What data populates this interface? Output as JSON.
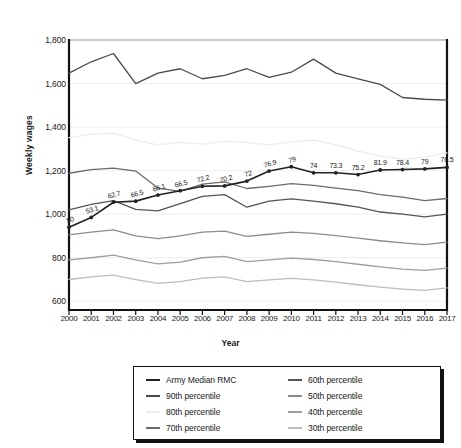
{
  "chart_data": {
    "type": "line",
    "title": "",
    "xlabel": "Year",
    "ylabel": "Weekly wages",
    "x": [
      2000,
      2001,
      2002,
      2003,
      2004,
      2005,
      2006,
      2007,
      2008,
      2009,
      2010,
      2011,
      2012,
      2013,
      2014,
      2015,
      2016,
      2017
    ],
    "xtick_labels": [
      "2000",
      "2001",
      "2002",
      "2003",
      "2004",
      "2005",
      "2006",
      "2007",
      "2008",
      "2009",
      "2010",
      "2011",
      "2012",
      "2013",
      "2014",
      "2015",
      "2016",
      "2017"
    ],
    "ylim": [
      560,
      1800
    ],
    "yticks": [
      600,
      800,
      1000,
      1200,
      1400,
      1600,
      1800
    ],
    "ytick_labels": [
      "600",
      "800",
      "1,000",
      "1,200",
      "1,400",
      "1,600",
      "1,800"
    ],
    "grid": "horizontal",
    "legend_position": "below-center",
    "series": [
      {
        "name": "Army Median RMC",
        "color": "#222222",
        "width": 1.6,
        "markers": true,
        "values": [
          940,
          985,
          1055,
          1060,
          1088,
          1108,
          1128,
          1130,
          1152,
          1198,
          1218,
          1190,
          1190,
          1182,
          1203,
          1205,
          1208,
          1215
        ],
        "point_labels": [
          "50",
          "53.1",
          "62.7",
          "66.5",
          "66.1",
          "66.5",
          "72.2",
          "70.2",
          "72",
          "76.9",
          "79",
          "74",
          "73.3",
          "75.2",
          "81.9",
          "78.4",
          "79",
          "76.5"
        ]
      },
      {
        "name": "90th percentile",
        "color": "#4a4a4a",
        "width": 1.3,
        "markers": false,
        "values": [
          1648,
          1700,
          1738,
          1600,
          1648,
          1668,
          1622,
          1638,
          1668,
          1628,
          1652,
          1712,
          1648,
          1622,
          1596,
          1536,
          1528,
          1524
        ]
      },
      {
        "name": "80th percentile",
        "color": "#ededed",
        "width": 1.3,
        "markers": false,
        "values": [
          1352,
          1368,
          1372,
          1340,
          1318,
          1330,
          1322,
          1336,
          1330,
          1318,
          1332,
          1340,
          1318,
          1290,
          1268,
          1252,
          1262,
          1282
        ]
      },
      {
        "name": "70th percentile",
        "color": "#6b6b6b",
        "width": 1.3,
        "markers": false,
        "values": [
          1188,
          1205,
          1212,
          1198,
          1120,
          1105,
          1138,
          1148,
          1118,
          1128,
          1140,
          1132,
          1120,
          1108,
          1090,
          1078,
          1062,
          1072
        ]
      },
      {
        "name": "60th percentile",
        "color": "#555555",
        "width": 1.3,
        "markers": false,
        "values": [
          1020,
          1045,
          1062,
          1022,
          1015,
          1048,
          1082,
          1090,
          1032,
          1060,
          1070,
          1060,
          1048,
          1032,
          1010,
          1000,
          988,
          1000
        ]
      },
      {
        "name": "50th percentile",
        "color": "#8c8c8c",
        "width": 1.3,
        "markers": false,
        "values": [
          905,
          918,
          928,
          900,
          888,
          900,
          918,
          922,
          898,
          908,
          918,
          912,
          902,
          890,
          878,
          868,
          860,
          872
        ]
      },
      {
        "name": "40th percentile",
        "color": "#9e9e9e",
        "width": 1.3,
        "markers": false,
        "values": [
          790,
          800,
          812,
          790,
          772,
          780,
          800,
          806,
          782,
          790,
          798,
          792,
          782,
          770,
          758,
          748,
          742,
          752
        ]
      },
      {
        "name": "30th percentile",
        "color": "#bdbdbd",
        "width": 1.3,
        "markers": false,
        "values": [
          700,
          712,
          720,
          700,
          682,
          690,
          706,
          712,
          690,
          698,
          705,
          698,
          688,
          676,
          665,
          656,
          650,
          662
        ]
      }
    ]
  },
  "legend": {
    "items": [
      {
        "label": "Army Median RMC",
        "color": "#222222",
        "width": 2.4
      },
      {
        "label": "60th percentile",
        "color": "#555555",
        "width": 2
      },
      {
        "label": "90th percentile",
        "color": "#4a4a4a",
        "width": 2
      },
      {
        "label": "50th percentile",
        "color": "#8c8c8c",
        "width": 2
      },
      {
        "label": "80th percentile",
        "color": "#ededed",
        "width": 2
      },
      {
        "label": "40th percentile",
        "color": "#9e9e9e",
        "width": 2
      },
      {
        "label": "70th percentile",
        "color": "#6b6b6b",
        "width": 2
      },
      {
        "label": "30th percentile",
        "color": "#bdbdbd",
        "width": 2
      }
    ]
  }
}
